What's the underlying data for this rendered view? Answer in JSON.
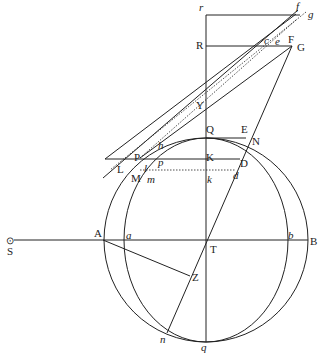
{
  "diagram": {
    "labels": {
      "r": "r",
      "f": "f",
      "g": "g",
      "R": "R",
      "c": "c",
      "e": "e",
      "F": "F",
      "G": "G",
      "Y": "Y",
      "h": "h",
      "Q": "Q",
      "E": "E",
      "N": "N",
      "P": "P",
      "L": "L",
      "M": "M",
      "l": "l",
      "m": "m",
      "p": "p",
      "K": "K",
      "D": "D",
      "k": "k",
      "d": "d",
      "S": "S",
      "A": "A",
      "a": "a",
      "T": "T",
      "b": "b",
      "B": "B",
      "Z": "Z",
      "n": "n",
      "q": "q"
    },
    "sun_symbol": "⊙"
  }
}
